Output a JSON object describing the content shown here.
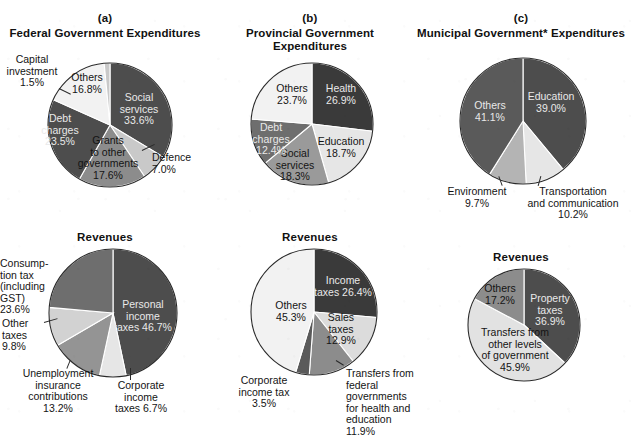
{
  "palette": {
    "very_dark": "#3a3a3a",
    "dark": "#4d4d4d",
    "mid_dark": "#6e6e6e",
    "mid": "#8c8c8c",
    "light": "#c9c9c9",
    "very_light": "#e6e6e6",
    "near_white": "#f2f2f2",
    "outline": "#2a2a2a",
    "text_dark": "#141414",
    "text_light": "#e9e9e9",
    "background": "#ffffff"
  },
  "panels": {
    "a": {
      "letter": "(a)",
      "title": "Federal Government\nExpenditures",
      "revenues_title": "Revenues"
    },
    "b": {
      "letter": "(b)",
      "title": "Provincial Government\nExpenditures",
      "revenues_title": "Revenues"
    },
    "c": {
      "letter": "(c)",
      "title": "Municipal Government*\nExpenditures",
      "revenues_title": "Revenues"
    }
  },
  "chart_data": [
    {
      "id": "federal-expenditures",
      "type": "pie",
      "title": "Federal Government Expenditures",
      "panel": "(a)",
      "start_angle_deg": 0,
      "direction": "clockwise",
      "categories": [
        "Social services",
        "Defence",
        "Grants to other governments",
        "Debt charges",
        "Others",
        "Capital investment"
      ],
      "values": [
        33.6,
        7.0,
        17.6,
        23.5,
        16.8,
        1.5
      ],
      "unit": "%",
      "labels": [
        {
          "text": "Social\nservices\n33.6%",
          "value": 33.6,
          "placement": "inside",
          "tone": "on-dark"
        },
        {
          "text": "Defence\n7.0%",
          "value": 7.0,
          "placement": "outside",
          "tone": "on-light"
        },
        {
          "text": "Grants\nto other\ngovernments\n17.6%",
          "value": 17.6,
          "placement": "inside",
          "tone": "on-light"
        },
        {
          "text": "Debt\ncharges\n23.5%",
          "value": 23.5,
          "placement": "inside",
          "tone": "on-dark"
        },
        {
          "text": "Others\n16.8%",
          "value": 16.8,
          "placement": "inside",
          "tone": "on-light"
        },
        {
          "text": "Capital\ninvestment\n1.5%",
          "value": 1.5,
          "placement": "outside",
          "tone": "on-light"
        }
      ],
      "slice_colors": [
        "#4d4d4d",
        "#c9c9c9",
        "#8c8c8c",
        "#4d4d4d",
        "#f2f2f2",
        "#c9c9c9"
      ]
    },
    {
      "id": "provincial-expenditures",
      "type": "pie",
      "title": "Provincial Government Expenditures",
      "panel": "(b)",
      "start_angle_deg": 0,
      "direction": "clockwise",
      "categories": [
        "Health",
        "Education",
        "Social services",
        "Debt charges",
        "Others"
      ],
      "values": [
        26.9,
        18.7,
        18.3,
        12.4,
        23.7
      ],
      "unit": "%",
      "labels": [
        {
          "text": "Health\n26.9%",
          "value": 26.9,
          "placement": "inside",
          "tone": "on-dark"
        },
        {
          "text": "Education\n18.7%",
          "value": 18.7,
          "placement": "inside",
          "tone": "on-light"
        },
        {
          "text": "Social\nservices\n18.3%",
          "value": 18.3,
          "placement": "inside",
          "tone": "on-light"
        },
        {
          "text": "Debt\ncharges\n12.4%",
          "value": 12.4,
          "placement": "inside",
          "tone": "on-dark"
        },
        {
          "text": "Others\n23.7%",
          "value": 23.7,
          "placement": "inside",
          "tone": "on-light"
        }
      ],
      "slice_colors": [
        "#3a3a3a",
        "#e6e6e6",
        "#9a9a9a",
        "#6e6e6e",
        "#f2f2f2"
      ]
    },
    {
      "id": "municipal-expenditures",
      "type": "pie",
      "title": "Municipal Government* Expenditures",
      "panel": "(c)",
      "start_angle_deg": 0,
      "direction": "clockwise",
      "categories": [
        "Education",
        "Transportation and communication",
        "Environment",
        "Others"
      ],
      "values": [
        39.0,
        10.2,
        9.7,
        41.1
      ],
      "unit": "%",
      "labels": [
        {
          "text": "Education\n39.0%",
          "value": 39.0,
          "placement": "inside",
          "tone": "on-dark"
        },
        {
          "text": "Transportation\nand communication\n10.2%",
          "value": 10.2,
          "placement": "outside",
          "tone": "on-light"
        },
        {
          "text": "Environment\n9.7%",
          "value": 9.7,
          "placement": "outside",
          "tone": "on-light"
        },
        {
          "text": "Others\n41.1%",
          "value": 41.1,
          "placement": "inside",
          "tone": "on-dark"
        }
      ],
      "slice_colors": [
        "#4d4d4d",
        "#e6e6e6",
        "#b4b4b4",
        "#5a5a5a"
      ]
    },
    {
      "id": "federal-revenues",
      "type": "pie",
      "title": "Revenues",
      "panel": "(a)",
      "start_angle_deg": 0,
      "direction": "clockwise",
      "categories": [
        "Personal income taxes",
        "Corporate income taxes",
        "Unemployment insurance contributions",
        "Other taxes",
        "Consumption tax (including GST)"
      ],
      "values": [
        46.7,
        6.7,
        13.2,
        9.8,
        23.6
      ],
      "unit": "%",
      "labels": [
        {
          "text": "Personal\nincome\ntaxes 46.7%",
          "value": 46.7,
          "placement": "inside",
          "tone": "on-dark"
        },
        {
          "text": "Corporate\nincome\ntaxes 6.7%",
          "value": 6.7,
          "placement": "outside",
          "tone": "on-light"
        },
        {
          "text": "Unemployment\ninsurance\ncontributions\n13.2%",
          "value": 13.2,
          "placement": "outside",
          "tone": "on-light"
        },
        {
          "text": "Other\ntaxes\n9.8%",
          "value": 9.8,
          "placement": "outside",
          "tone": "on-light"
        },
        {
          "text": "Consump-\ntion tax\n(including\nGST)\n23.6%",
          "value": 23.6,
          "placement": "outside",
          "tone": "on-light"
        }
      ],
      "slice_colors": [
        "#4d4d4d",
        "#e6e6e6",
        "#949494",
        "#d2d2d2",
        "#6e6e6e"
      ]
    },
    {
      "id": "provincial-revenues",
      "type": "pie",
      "title": "Revenues",
      "panel": "(b)",
      "start_angle_deg": 0,
      "direction": "clockwise",
      "categories": [
        "Income taxes",
        "Sales taxes",
        "Transfers from federal governments for health and education",
        "Corporate income tax",
        "Others"
      ],
      "values": [
        26.4,
        12.9,
        11.9,
        3.5,
        45.3
      ],
      "unit": "%",
      "labels": [
        {
          "text": "Income\ntaxes 26.4%",
          "value": 26.4,
          "placement": "inside",
          "tone": "on-dark"
        },
        {
          "text": "Sales\ntaxes\n12.9%",
          "value": 12.9,
          "placement": "inside",
          "tone": "on-light"
        },
        {
          "text": "Transfers from\nfederal governments\nfor health and education\n11.9%",
          "value": 11.9,
          "placement": "outside",
          "tone": "on-light"
        },
        {
          "text": "Corporate\nincome tax\n3.5%",
          "value": 3.5,
          "placement": "outside",
          "tone": "on-light"
        },
        {
          "text": "Others\n45.3%",
          "value": 45.3,
          "placement": "inside",
          "tone": "on-light"
        }
      ],
      "slice_colors": [
        "#3a3a3a",
        "#dcdcdc",
        "#8c8c8c",
        "#5a5a5a",
        "#f2f2f2"
      ]
    },
    {
      "id": "municipal-revenues",
      "type": "pie",
      "title": "Revenues",
      "panel": "(c)",
      "start_angle_deg": 0,
      "direction": "clockwise",
      "categories": [
        "Property taxes",
        "Transfers from other levels of government",
        "Others"
      ],
      "values": [
        36.9,
        45.9,
        17.2
      ],
      "unit": "%",
      "labels": [
        {
          "text": "Property\ntaxes\n36.9%",
          "value": 36.9,
          "placement": "inside",
          "tone": "on-dark"
        },
        {
          "text": "Transfers from\nother levels\nof government\n45.9%",
          "value": 45.9,
          "placement": "inside",
          "tone": "on-light"
        },
        {
          "text": "Others\n17.2%",
          "value": 17.2,
          "placement": "inside",
          "tone": "on-light"
        }
      ],
      "slice_colors": [
        "#4d4d4d",
        "#e2e2e2",
        "#8c8c8c"
      ]
    }
  ]
}
